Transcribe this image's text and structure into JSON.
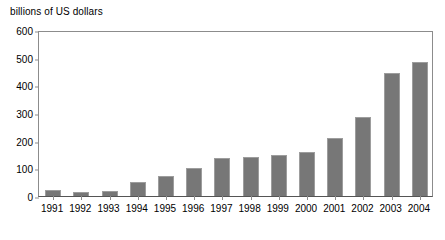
{
  "chart_data": {
    "type": "bar",
    "title": "",
    "ylabel": "billions of US dollars",
    "xlabel": "",
    "ylim": [
      0,
      600
    ],
    "yticks": [
      0,
      100,
      200,
      300,
      400,
      500,
      600
    ],
    "grid": false,
    "legend": null,
    "bar_color": "#777777",
    "bar_edge_color": "#9d9d9d",
    "axis_color": "#8c8c8c",
    "categories": [
      "1991",
      "1992",
      "1993",
      "1994",
      "1995",
      "1996",
      "1997",
      "1998",
      "1999",
      "2000",
      "2001",
      "2002",
      "2003",
      "2004"
    ],
    "values": [
      20,
      14,
      18,
      51,
      72,
      102,
      136,
      141,
      150,
      160,
      210,
      285,
      445,
      483
    ]
  }
}
